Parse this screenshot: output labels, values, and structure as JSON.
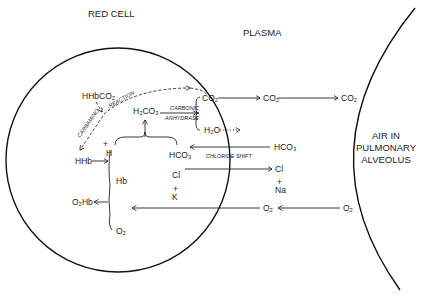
{
  "regions": {
    "red_cell": "RED CELL",
    "plasma": "PLASMA",
    "alveolus_line1": "AIR IN",
    "alveolus_line2": "PULMONARY",
    "alveolus_line3": "ALVEOLUS"
  },
  "red_cell_species": {
    "hhbco2": "HHbCO₂",
    "carbamino": "CARBAMINO",
    "reaction": "REACTION",
    "h2co3": "H₂CO₃",
    "carbonic": "CARBONIC",
    "anhydrase": "ANHYDRASE",
    "co2": "CO₂",
    "h2o": "H₂O",
    "h_plus": "H",
    "hco3": "HCO₃",
    "hhb": "HHb",
    "hb": "Hb",
    "cl": "Cl",
    "k": "K",
    "o2hb": "O₂Hb",
    "o2": "O₂"
  },
  "plasma_species": {
    "co2": "CO₂",
    "hco3": "HCO₃",
    "cl": "Cl",
    "na": "Na",
    "o2": "O₂",
    "chloride_shift": "CHLORIDE SHIFT"
  },
  "alveolus_species": {
    "co2": "CO₂",
    "o2": "O₂"
  },
  "symbols": {
    "plus": "+",
    "minus": "−"
  }
}
